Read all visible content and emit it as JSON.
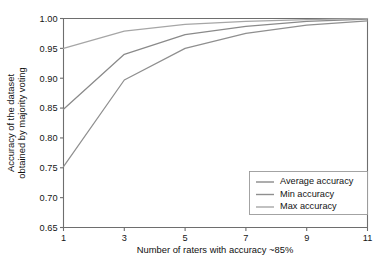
{
  "chart_data": {
    "type": "line",
    "title": "",
    "xlabel": "Number of raters with accuracy ~85%",
    "ylabel_line1": "Accuracy of the dataset",
    "ylabel_line2": "obtained by majority voting",
    "x": [
      1,
      3,
      5,
      7,
      9,
      11
    ],
    "xlim": [
      1,
      11
    ],
    "ylim": [
      0.65,
      1.0
    ],
    "xticks": [
      "1",
      "3",
      "5",
      "7",
      "9",
      "11"
    ],
    "xtick_values": [
      1,
      3,
      5,
      7,
      9,
      11
    ],
    "yticks": [
      "0.65",
      "0.70",
      "0.75",
      "0.80",
      "0.85",
      "0.90",
      "0.95",
      "1.00"
    ],
    "ytick_values": [
      0.65,
      0.7,
      0.75,
      0.8,
      0.85,
      0.9,
      0.95,
      1.0
    ],
    "grid": false,
    "legend_position": "lower right",
    "series": [
      {
        "name": "Average accuracy",
        "color": "#8a8a8a",
        "values": [
          0.848,
          0.94,
          0.973,
          0.987,
          0.995,
          0.999
        ]
      },
      {
        "name": "Min accuracy",
        "color": "#8f8f8f",
        "values": [
          0.752,
          0.897,
          0.95,
          0.975,
          0.989,
          0.996
        ]
      },
      {
        "name": "Max accuracy",
        "color": "#a6a6a6",
        "values": [
          0.95,
          0.979,
          0.99,
          0.995,
          0.998,
          1.0
        ]
      }
    ]
  },
  "legend": {
    "items": [
      {
        "label": "Average accuracy",
        "color": "#8a8a8a"
      },
      {
        "label": "Min accuracy",
        "color": "#8f8f8f"
      },
      {
        "label": "Max accuracy",
        "color": "#a6a6a6"
      }
    ]
  },
  "axes": {
    "x_title": "Number of raters with accuracy ~85%",
    "y_title_line1": "Accuracy of the dataset",
    "y_title_line2": "obtained by majority voting"
  }
}
